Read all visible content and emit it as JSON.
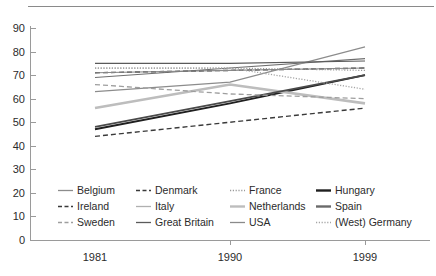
{
  "chart_data": {
    "type": "line",
    "title": "",
    "xlabel": "",
    "ylabel": "",
    "x": [
      "1981",
      "1990",
      "1999"
    ],
    "xtick_labels": [
      "1981",
      "1990",
      "1999"
    ],
    "ytick_labels": [
      "0",
      "10",
      "20",
      "30",
      "40",
      "50",
      "60",
      "70",
      "80",
      "90"
    ],
    "yticks": [
      0,
      10,
      20,
      30,
      40,
      50,
      60,
      70,
      80,
      90
    ],
    "ylim": [
      0,
      90
    ],
    "grid": false,
    "legend_position": "inside-bottom-left",
    "series": [
      {
        "name": "Belgium",
        "values": [
          69,
          73,
          77
        ],
        "color": "#6e6e6e",
        "style": "solid-thin",
        "width": 1.1
      },
      {
        "name": "Denmark",
        "values": [
          71,
          72,
          73
        ],
        "color": "#3a3a3a",
        "style": "dashed",
        "width": 1.4
      },
      {
        "name": "France",
        "values": [
          73,
          73,
          72
        ],
        "color": "#9a9a9a",
        "style": "dotted",
        "width": 1.2
      },
      {
        "name": "Hungary",
        "values": [
          47,
          58,
          70
        ],
        "color": "#1f1f1f",
        "style": "solid-thick",
        "width": 1.9
      },
      {
        "name": "Ireland",
        "values": [
          44,
          50,
          56
        ],
        "color": "#3a3a3a",
        "style": "dashed",
        "width": 1.4
      },
      {
        "name": "Italy",
        "values": [
          63,
          67,
          82
        ],
        "color": "#8c8c8c",
        "style": "solid-thin",
        "width": 1.2
      },
      {
        "name": "Netherlands",
        "values": [
          56,
          66,
          58
        ],
        "color": "#bdbdbd",
        "style": "solid-thick",
        "width": 2.6
      },
      {
        "name": "Spain",
        "values": [
          48,
          59,
          70
        ],
        "color": "#4a4a4a",
        "style": "solid-thick",
        "width": 1.8
      },
      {
        "name": "Sweden",
        "values": [
          66,
          62,
          60
        ],
        "color": "#9e9e9e",
        "style": "dashed",
        "width": 1.3
      },
      {
        "name": "Great Britain",
        "values": [
          75,
          75,
          76
        ],
        "color": "#5a5a5a",
        "style": "solid-thin",
        "width": 1.2
      },
      {
        "name": "USA",
        "values": [
          71,
          72,
          73
        ],
        "color": "#8a8a8a",
        "style": "solid-thin",
        "width": 1.1
      },
      {
        "name": "(West) Germany",
        "values": [
          73,
          73,
          64
        ],
        "color": "#a5a5a5",
        "style": "dotted",
        "width": 1.3
      }
    ]
  },
  "legend": {
    "items": [
      {
        "label": "Belgium",
        "swatch": "solid-thin",
        "color": "#8c8c8c"
      },
      {
        "label": "Denmark",
        "swatch": "dashed",
        "color": "#3a3a3a"
      },
      {
        "label": "France",
        "swatch": "dotted",
        "color": "#9a9a9a"
      },
      {
        "label": "Hungary",
        "swatch": "solid-thick",
        "color": "#1f1f1f"
      },
      {
        "label": "Ireland",
        "swatch": "dashed",
        "color": "#3a3a3a"
      },
      {
        "label": "Italy",
        "swatch": "solid-thin",
        "color": "#b0b0b0"
      },
      {
        "label": "Netherlands",
        "swatch": "solid-thick",
        "color": "#bdbdbd"
      },
      {
        "label": "Spain",
        "swatch": "solid-thick",
        "color": "#6a6a6a"
      },
      {
        "label": "Sweden",
        "swatch": "dashed",
        "color": "#9e9e9e"
      },
      {
        "label": "Great Britain",
        "swatch": "solid-thin",
        "color": "#5a5a5a"
      },
      {
        "label": "USA",
        "swatch": "solid-thin",
        "color": "#8a8a8a"
      },
      {
        "label": "(West) Germany",
        "swatch": "dotted",
        "color": "#a5a5a5"
      }
    ]
  }
}
